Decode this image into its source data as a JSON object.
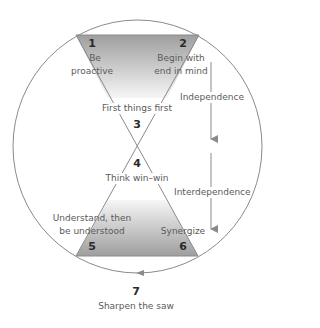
{
  "diagram": {
    "habits": [
      {
        "number": "1",
        "label": "Be proactive",
        "lines": [
          "Be",
          "proactive"
        ]
      },
      {
        "number": "2",
        "label": "Begin with end in mind",
        "lines": [
          "Begin with",
          "end in mind"
        ]
      },
      {
        "number": "3",
        "label": "First things first"
      },
      {
        "number": "4",
        "label": "Think win–win"
      },
      {
        "number": "5",
        "label": "Understand, then be understood",
        "lines": [
          "Understand, then",
          "be understood"
        ]
      },
      {
        "number": "6",
        "label": "Synergize"
      },
      {
        "number": "7",
        "label": "Sharpen the saw"
      }
    ],
    "stages": [
      {
        "label": "Independence"
      },
      {
        "label": "Interdependence"
      }
    ],
    "colors": {
      "line": "#8a8a8a",
      "fill_dark": "#9e9e9e",
      "fill_light": "#f4f4f4",
      "text": "#5a5a5a",
      "number": "#2a2a2a"
    }
  }
}
